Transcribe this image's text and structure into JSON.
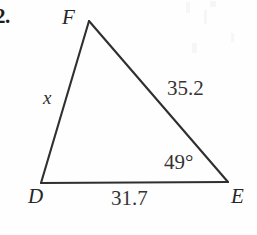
{
  "figure": {
    "type": "triangle-diagram",
    "problem_number": "2.",
    "ink_color": "#2b2b2b",
    "background_color": "#fefefe",
    "vertices": [
      {
        "name": "F",
        "label": "F",
        "x": 89,
        "y": 21,
        "label_x": 62,
        "label_y": 7
      },
      {
        "name": "D",
        "label": "D",
        "x": 41,
        "y": 183,
        "label_x": 28,
        "label_y": 186
      },
      {
        "name": "E",
        "label": "E",
        "x": 228,
        "y": 182,
        "label_x": 231,
        "label_y": 186
      }
    ],
    "sides": [
      {
        "name": "DF",
        "label": "x",
        "known": false,
        "label_x": 43,
        "label_y": 88
      },
      {
        "name": "FE",
        "label": "35.2",
        "known": true,
        "value": 35.2,
        "label_x": 167,
        "label_y": 78
      },
      {
        "name": "DE",
        "label": "31.7",
        "known": true,
        "value": 31.7,
        "label_x": 111,
        "label_y": 188
      }
    ],
    "angles": [
      {
        "at": "E",
        "label": "49°",
        "value": 49,
        "unit": "degrees",
        "label_x": 164,
        "label_y": 152
      }
    ],
    "unknown": "x"
  }
}
